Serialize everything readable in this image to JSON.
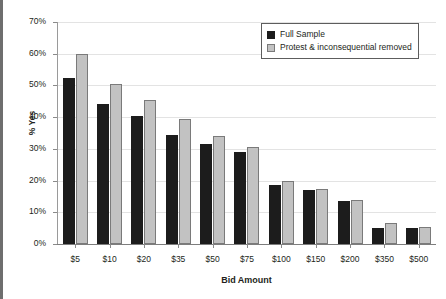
{
  "chart_data": {
    "type": "bar",
    "title": "",
    "xlabel": "Bid Amount",
    "ylabel": "% Yes",
    "categories": [
      "$5",
      "$10",
      "$20",
      "$35",
      "$50",
      "$75",
      "$100",
      "$150",
      "$200",
      "$350",
      "$500"
    ],
    "series": [
      {
        "name": "Full Sample",
        "color": "#1c1c1c",
        "values": [
          52.5,
          44.0,
          40.5,
          34.5,
          31.5,
          29.0,
          18.5,
          17.0,
          13.5,
          5.0,
          5.0
        ]
      },
      {
        "name": "Protest & inconsequential removed",
        "color": "#c2c2c2",
        "values": [
          60.0,
          50.5,
          45.5,
          39.5,
          34.0,
          30.5,
          20.0,
          17.5,
          14.0,
          6.5,
          5.5
        ]
      }
    ],
    "ylim": [
      0,
      70
    ],
    "ytick_values": [
      0,
      10,
      20,
      30,
      40,
      50,
      60,
      70
    ],
    "ytick_labels": [
      "0%",
      "10%",
      "20%",
      "30%",
      "40%",
      "50%",
      "60%",
      "70%"
    ],
    "grid": true,
    "legend_position": "top-right"
  }
}
